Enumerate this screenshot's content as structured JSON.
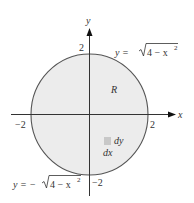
{
  "diagram": {
    "colors": {
      "region_fill": "#ececec",
      "circle_stroke": "#555555",
      "axis_stroke": "#333333",
      "element_fill": "#c8c8c8",
      "text": "#333333"
    },
    "axes": {
      "x_label": "x",
      "y_label": "y"
    },
    "ticks": {
      "x_neg": "−2",
      "x_pos": "2",
      "y_pos": "2",
      "y_neg": "−2"
    },
    "region_label": "R",
    "curves": {
      "upper": {
        "prefix": "y = ",
        "radicand": "4 − x",
        "exponent": "2"
      },
      "lower": {
        "prefix": "y = −",
        "radicand": "4 − x",
        "exponent": "2"
      }
    },
    "element": {
      "dy_label": "dy",
      "dx_label": "dx"
    }
  }
}
